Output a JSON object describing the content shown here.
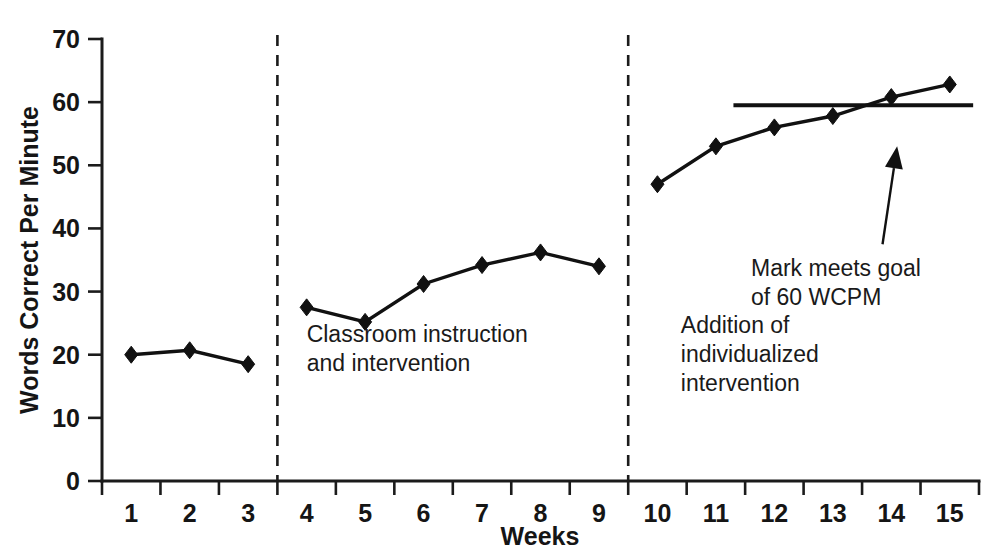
{
  "chart_data": {
    "type": "line",
    "title": "",
    "subtitle": "",
    "xlabel": "Weeks",
    "ylabel": "Words Correct Per Minute",
    "x": [
      1,
      2,
      3,
      4,
      5,
      6,
      7,
      8,
      9,
      10,
      11,
      12,
      13,
      14,
      15
    ],
    "xticklabels": [
      "1",
      "2",
      "3",
      "4",
      "5",
      "6",
      "7",
      "8",
      "9",
      "10",
      "11",
      "12",
      "13",
      "14",
      "15"
    ],
    "yticklabels": [
      "0",
      "10",
      "20",
      "30",
      "40",
      "50",
      "60",
      "70"
    ],
    "yticks": [
      0,
      10,
      20,
      30,
      40,
      50,
      60,
      70
    ],
    "ylim": [
      0,
      70
    ],
    "xlim": [
      0.5,
      15.5
    ],
    "grid": false,
    "legend": false,
    "series": [
      {
        "name": "Words Correct Per Minute",
        "marker": "diamond",
        "color": "#111111",
        "segments": [
          {
            "phase": "baseline",
            "x": [
              1,
              2,
              3
            ],
            "values": [
              20.0,
              20.7,
              18.5
            ]
          },
          {
            "phase": "classroom-instruction-and-intervention",
            "x": [
              4,
              5,
              6,
              7,
              8,
              9
            ],
            "values": [
              27.5,
              25.2,
              31.2,
              34.2,
              36.2,
              34.0
            ]
          },
          {
            "phase": "addition-of-individualized-intervention",
            "x": [
              10,
              11,
              12,
              13,
              14,
              15
            ],
            "values": [
              47.0,
              53.0,
              56.0,
              57.8,
              60.8,
              62.8
            ]
          }
        ]
      }
    ],
    "reference_lines": [
      {
        "name": "goal-line",
        "orientation": "horizontal",
        "value": 59.5,
        "x_start": 11.3,
        "x_end": 15.4,
        "color": "#111111"
      }
    ],
    "phase_dividers": [
      {
        "name": "divider-baseline-to-classroom",
        "x": 3.5
      },
      {
        "name": "divider-classroom-to-individualized",
        "x": 9.5
      }
    ],
    "phase_labels": [
      {
        "name": "classroom-instruction-label",
        "lines": [
          "Classroom instruction",
          "and intervention"
        ],
        "x": 4.0,
        "y": 22.0
      },
      {
        "name": "individualized-intervention-label",
        "lines": [
          "Addition of",
          "individualized",
          "intervention"
        ],
        "x": 10.4,
        "y": 23.5
      }
    ],
    "annotations": [
      {
        "name": "goal-met-annotation",
        "lines": [
          "Mark meets goal",
          "of 60 WCPM"
        ],
        "arrow": {
          "from_x": 13.85,
          "from_y": 37.5,
          "to_x": 14.1,
          "to_y": 53.0
        }
      }
    ]
  },
  "axis": {
    "x_title": "Weeks",
    "y_title": "Words Correct Per Minute"
  }
}
